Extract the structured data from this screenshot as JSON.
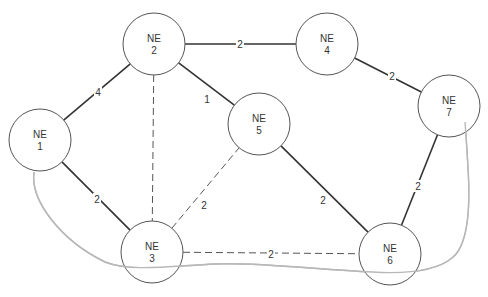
{
  "diagram": {
    "type": "network-graph",
    "nodes": [
      {
        "id": "1",
        "line1": "NE",
        "line2": "1",
        "x": 40,
        "y": 140
      },
      {
        "id": "2",
        "line1": "NE",
        "line2": "2",
        "x": 154,
        "y": 44
      },
      {
        "id": "3",
        "line1": "NE",
        "line2": "3",
        "x": 152,
        "y": 252
      },
      {
        "id": "4",
        "line1": "NE",
        "line2": "4",
        "x": 327,
        "y": 44
      },
      {
        "id": "5",
        "line1": "NE",
        "line2": "5",
        "x": 259,
        "y": 124
      },
      {
        "id": "6",
        "line1": "NE",
        "line2": "6",
        "x": 390,
        "y": 254
      },
      {
        "id": "7",
        "line1": "NE",
        "line2": "7",
        "x": 449,
        "y": 106
      }
    ],
    "edges": [
      {
        "from": "1",
        "to": "2",
        "label": "4",
        "style": "solid",
        "lx": 98,
        "ly": 92
      },
      {
        "from": "2",
        "to": "4",
        "label": "2",
        "style": "solid",
        "lx": 240,
        "ly": 44
      },
      {
        "from": "2",
        "to": "5",
        "label": "1",
        "style": "solid",
        "lx": 207,
        "ly": 99
      },
      {
        "from": "4",
        "to": "7",
        "label": "2",
        "style": "solid",
        "lx": 392,
        "ly": 76
      },
      {
        "from": "1",
        "to": "3",
        "label": "2",
        "style": "solid",
        "lx": 97,
        "ly": 199
      },
      {
        "from": "5",
        "to": "6",
        "label": "2",
        "style": "solid",
        "lx": 323,
        "ly": 200
      },
      {
        "from": "7",
        "to": "6",
        "label": "2",
        "style": "solid",
        "lx": 418,
        "ly": 186
      },
      {
        "from": "2",
        "to": "3",
        "label": "",
        "style": "dashed",
        "lx": 0,
        "ly": 0
      },
      {
        "from": "3",
        "to": "5",
        "label": "2",
        "style": "dashed",
        "lx": 204,
        "ly": 205
      },
      {
        "from": "3",
        "to": "6",
        "label": "2",
        "style": "dashed",
        "lx": 271,
        "ly": 254
      }
    ],
    "ring": {
      "color": "#b8b8b8",
      "description": "grey curve connecting NE1, NE3, NE6, NE7"
    }
  }
}
